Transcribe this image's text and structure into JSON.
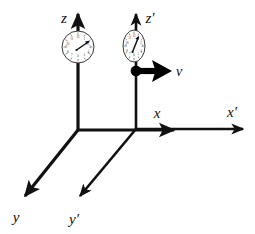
{
  "figure": {
    "background_color": "#ffffff",
    "ink_color": "#111111",
    "width": 255,
    "height": 234
  },
  "frames": [
    {
      "id": "rest-frame",
      "name": "unprimed frame",
      "origin": {
        "x": 78,
        "y": 130
      },
      "axes": [
        {
          "name": "z-axis",
          "label": "z",
          "label_pos": {
            "x": 64,
            "y": 23
          },
          "direction": "up"
        },
        {
          "name": "x-axis",
          "label": "x",
          "label_pos": {
            "x": 157,
            "y": 118
          },
          "direction": "right"
        },
        {
          "name": "y-axis",
          "label": "y",
          "label_pos": {
            "x": 12,
            "y": 222
          },
          "direction": "down-left"
        }
      ],
      "clock": {
        "name": "clock-rest",
        "shape": "circle",
        "center": {
          "x": 78,
          "y": 47
        },
        "radius_x": 16,
        "radius_y": 16,
        "hand_angle_deg": 50,
        "numerals": [
          "12",
          "1",
          "2",
          "3",
          "4",
          "5",
          "6",
          "7",
          "8",
          "9",
          "10",
          "11"
        ]
      }
    },
    {
      "id": "moving-frame",
      "name": "primed frame",
      "origin": {
        "x": 136,
        "y": 129
      },
      "axes": [
        {
          "name": "z-prime-axis",
          "label": "z′",
          "label_pos": {
            "x": 146,
            "y": 23
          },
          "direction": "up"
        },
        {
          "name": "x-prime-axis",
          "label": "x′",
          "label_pos": {
            "x": 228,
            "y": 117
          },
          "direction": "right"
        },
        {
          "name": "y-prime-axis",
          "label": "y′",
          "label_pos": {
            "x": 70,
            "y": 224
          },
          "direction": "down-left"
        }
      ],
      "clock": {
        "name": "clock-moving",
        "shape": "ellipse",
        "center": {
          "x": 134,
          "y": 46
        },
        "radius_x": 11,
        "radius_y": 16,
        "hand_angle_deg": 35,
        "numerals": [
          "12",
          "1",
          "2",
          "3",
          "4",
          "5",
          "6",
          "7",
          "8",
          "9",
          "10",
          "11"
        ]
      }
    }
  ],
  "velocity": {
    "name": "velocity-vector",
    "label": "v",
    "label_pos": {
      "x": 176,
      "y": 75
    },
    "arrow_from": {
      "x": 136,
      "y": 71
    },
    "arrow_to": {
      "x": 168,
      "y": 71
    },
    "origin_dot": {
      "x": 136,
      "y": 71,
      "r": 5
    }
  },
  "labels": {
    "z": "z",
    "z_prime": "z′",
    "x": "x",
    "x_prime": "x′",
    "y": "y",
    "y_prime": "y′",
    "v": "v"
  }
}
